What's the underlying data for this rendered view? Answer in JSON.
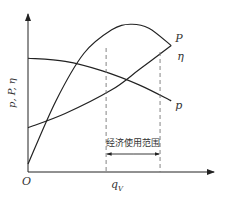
{
  "chart_data": {
    "type": "line",
    "title": "",
    "xlabel": "q",
    "xlabel_sub": "V",
    "ylabel": "p, P, η",
    "origin_label": "O",
    "xlim": [
      0,
      1
    ],
    "ylim": [
      0,
      1
    ],
    "grid": false,
    "series": [
      {
        "name": "η",
        "label": "η",
        "points": [
          [
            0,
            0.05
          ],
          [
            0.15,
            0.45
          ],
          [
            0.3,
            0.75
          ],
          [
            0.45,
            0.9
          ],
          [
            0.55,
            0.935
          ],
          [
            0.65,
            0.91
          ],
          [
            0.77,
            0.8
          ]
        ]
      },
      {
        "name": "P",
        "label": "P",
        "points": [
          [
            0,
            0.28
          ],
          [
            0.2,
            0.37
          ],
          [
            0.45,
            0.52
          ],
          [
            0.6,
            0.65
          ],
          [
            0.77,
            0.8
          ]
        ]
      },
      {
        "name": "p",
        "label": "p",
        "points": [
          [
            0,
            0.72
          ],
          [
            0.2,
            0.7
          ],
          [
            0.4,
            0.64
          ],
          [
            0.6,
            0.55
          ],
          [
            0.77,
            0.45
          ]
        ]
      }
    ],
    "range": {
      "label": "经济使用范围",
      "from": 0.42,
      "to": 0.71
    }
  }
}
